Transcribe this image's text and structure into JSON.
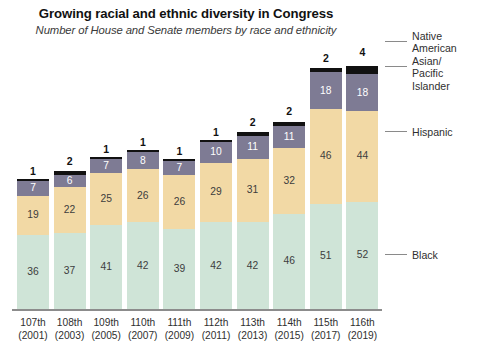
{
  "chart_data": {
    "type": "bar",
    "subtype": "stacked-column",
    "title": "Growing racial and ethnic diversity in Congress",
    "subtitle": "Number of House and Senate members by race and ethnicity",
    "xlabel": "",
    "ylabel": "",
    "grid": false,
    "legend_position": "right",
    "ylim": [
      0,
      118
    ],
    "categories": [
      "107th (2001)",
      "108th (2003)",
      "109th (2005)",
      "110th (2007)",
      "111th (2009)",
      "112th (2011)",
      "113th (2013)",
      "114th (2015)",
      "115th (2017)",
      "116th (2019)"
    ],
    "category_lines": [
      {
        "l1": "107th",
        "l2": "(2001)"
      },
      {
        "l1": "108th",
        "l2": "(2003)"
      },
      {
        "l1": "109th",
        "l2": "(2005)"
      },
      {
        "l1": "110th",
        "l2": "(2007)"
      },
      {
        "l1": "111th",
        "l2": "(2009)"
      },
      {
        "l1": "112th",
        "l2": "(2011)"
      },
      {
        "l1": "113th",
        "l2": "(2013)"
      },
      {
        "l1": "114th",
        "l2": "(2015)"
      },
      {
        "l1": "115th",
        "l2": "(2017)"
      },
      {
        "l1": "116th",
        "l2": "(2019)"
      }
    ],
    "series": [
      {
        "name": "Black",
        "color": "#cfe4d7",
        "values": [
          36,
          37,
          41,
          42,
          39,
          42,
          42,
          46,
          51,
          52
        ]
      },
      {
        "name": "Hispanic",
        "color": "#f2d9a5",
        "values": [
          19,
          22,
          25,
          26,
          26,
          29,
          31,
          32,
          46,
          44
        ]
      },
      {
        "name": "Asian/ Pacific Islander",
        "color": "#7e7b94",
        "values": [
          7,
          6,
          7,
          8,
          7,
          10,
          11,
          11,
          18,
          18
        ]
      },
      {
        "name": "Native American",
        "color": "#111111",
        "values": [
          1,
          2,
          1,
          1,
          1,
          1,
          2,
          2,
          2,
          4
        ]
      }
    ],
    "totals": [
      63,
      67,
      74,
      77,
      73,
      82,
      86,
      91,
      117,
      118
    ]
  },
  "legend": {
    "items": [
      {
        "label": "Native American",
        "lines": [
          "Native",
          "American"
        ],
        "color": "#111111"
      },
      {
        "label": "Asian/ Pacific Islander",
        "lines": [
          "Asian/",
          "Pacific",
          "Islander"
        ],
        "color": "#7e7b94"
      },
      {
        "label": "Hispanic",
        "lines": [
          "Hispanic"
        ],
        "color": "#f2d9a5"
      },
      {
        "label": "Black",
        "lines": [
          "Black"
        ],
        "color": "#cfe4d7"
      }
    ]
  },
  "colors": {
    "black_series": "#cfe4d7",
    "hispanic_series": "#f2d9a5",
    "asian_series": "#7e7b94",
    "native_series": "#111111",
    "axis": "#8c8c8c",
    "text": "#2f2f2f",
    "title": "#111111"
  }
}
